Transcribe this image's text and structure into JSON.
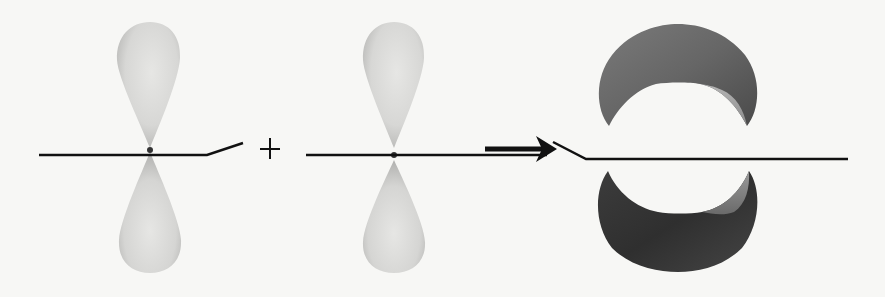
{
  "diagram": {
    "type": "orbital-overlap",
    "operator_plus": "+",
    "reactants": [
      {
        "id": "p-orbital-1",
        "kind": "p-orbital",
        "color": "#d9d9d7"
      },
      {
        "id": "p-orbital-2",
        "kind": "p-orbital",
        "color": "#d9d9d7"
      }
    ],
    "product": {
      "id": "pi-bond-orbital",
      "kind": "pi-orbital",
      "top_color": "#6e6e6e",
      "bottom_color": "#3a3a3a"
    },
    "arrow": {
      "direction": "right",
      "color": "#111111"
    },
    "colors": {
      "background": "#f7f7f5",
      "line": "#111111",
      "lobe_light": "#dcdcda",
      "lobe_shadow": "#a9a9a7"
    }
  }
}
